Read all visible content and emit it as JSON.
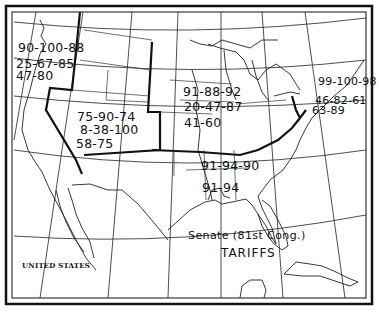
{
  "map": {
    "country_label": "UNITED STATES",
    "title_line1": "Senate (81st Cong.)",
    "title_line2": "TARIFFS",
    "colors": {
      "ink": "#111111",
      "paper": "#ffffff"
    }
  },
  "regions": {
    "pacific_northwest": {
      "line1": "90-100-88",
      "line2": "25-67-85",
      "line3": "47-80"
    },
    "mountain": {
      "line1": "75-90-74",
      "line2": "8-38-100",
      "line3": "58-75"
    },
    "midwest": {
      "line1": "91-88-92",
      "line2": "20-47-87",
      "line3": "41-60"
    },
    "northeast": {
      "line1": "99-100-98",
      "line2": "46-82-61",
      "line3": "63-89"
    },
    "south": {
      "line1": "91-94-90",
      "line2": "91-94"
    }
  }
}
